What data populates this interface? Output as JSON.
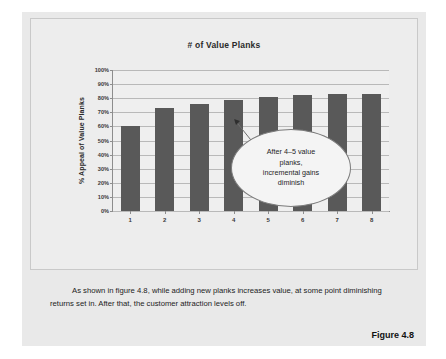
{
  "figure": {
    "number_label": "Figure 4.8",
    "caption": "As shown in figure 4.8, while adding new planks increases value, at some point diminishing returns set in. After that, the customer attraction levels off."
  },
  "callout": {
    "line1": "After 4–5 value",
    "line2": "planks,",
    "line3": "incremental gains",
    "line4": "diminish"
  },
  "colors": {
    "bar": "#595959",
    "page_background": "#e9e9e9",
    "plot_background": "#efefef",
    "gridline": "#b9b9b9",
    "axis": "#8d8d8d",
    "callout_fill": "#f4f4f4",
    "callout_border": "#7b7b7b",
    "text": "#1c1c1c"
  },
  "chart_data": {
    "type": "bar",
    "title": "# of Value Planks",
    "xlabel": "",
    "ylabel": "% Appeal of Value Planks",
    "categories": [
      "1",
      "2",
      "3",
      "4",
      "5",
      "6",
      "7",
      "8"
    ],
    "values": [
      60,
      73,
      76,
      79,
      81,
      82,
      83,
      83
    ],
    "ylim": [
      0,
      100
    ],
    "ytick_labels": [
      "100%",
      "90%",
      "80%",
      "70%",
      "60%",
      "50%",
      "40%",
      "30%",
      "20%",
      "10%",
      "0%"
    ],
    "ytick_values": [
      100,
      90,
      80,
      70,
      60,
      50,
      40,
      30,
      20,
      10,
      0
    ],
    "grid": true,
    "legend": "none",
    "annotations": [
      {
        "text": "After 4-5 value planks, incremental gains diminish",
        "target_category": "4"
      }
    ]
  }
}
